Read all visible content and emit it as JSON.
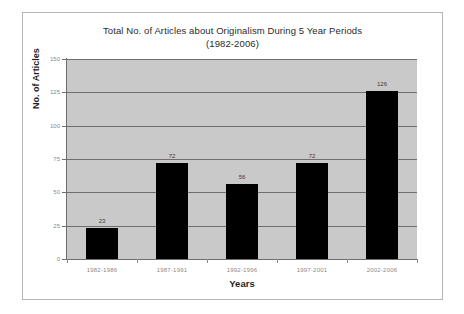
{
  "chart_data": {
    "type": "bar",
    "title": "Total No. of Articles about Originalism During 5 Year Periods\n(1982-2006)",
    "title_line1": "Total No. of Articles about Originalism During 5 Year Periods",
    "title_line2": "(1982-2006)",
    "categories": [
      "1982-1986",
      "1987-1991",
      "1992-1996",
      "1997-2001",
      "2002-2006"
    ],
    "values": [
      23,
      72,
      56,
      72,
      126
    ],
    "xlabel": "Years",
    "ylabel": "No. of Articles",
    "ylim": [
      0,
      150
    ],
    "yticks": [
      0,
      25,
      50,
      75,
      100,
      125,
      150
    ],
    "ytick_labels": [
      "0",
      "25",
      "50",
      "75",
      "100",
      "125",
      "150"
    ],
    "grid": true,
    "legend": false,
    "bar_color": "#000000",
    "plot_background": "#c9c9c9",
    "gridline_color": "#6e6e6e",
    "axis_color": "#6e6e6e",
    "tick_label_color": "#8a8a8a",
    "title_color": "#2a2a2a",
    "card_background": "#ffffff",
    "card_border_color": "#b4b4b4"
  }
}
